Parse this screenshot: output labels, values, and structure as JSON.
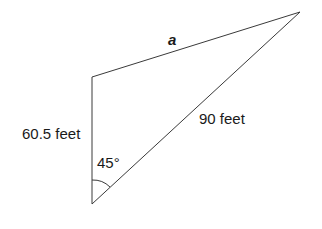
{
  "diagram": {
    "type": "triangle",
    "vertices": {
      "top_left": [
        92,
        77
      ],
      "top_right": [
        300,
        12
      ],
      "bottom": [
        92,
        204
      ]
    },
    "line_color": "#3a3a3a",
    "text_color": "#1a1a1a",
    "labels": {
      "top_side": "a",
      "left_side": "60.5 feet",
      "hypotenuse": "90 feet",
      "angle": "45°"
    }
  }
}
